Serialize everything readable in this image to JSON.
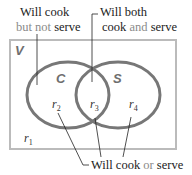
{
  "diagram": {
    "type": "venn",
    "universe": {
      "label": "V",
      "x": 10,
      "y": 40,
      "width": 166,
      "height": 109,
      "stroke": "#bbbbbb"
    },
    "sets": [
      {
        "label": "C",
        "cx": 68,
        "cy": 95,
        "rx": 41,
        "ry": 33,
        "label_x": 56,
        "label_y": 82
      },
      {
        "label": "S",
        "cx": 118,
        "cy": 95,
        "rx": 42,
        "ry": 33,
        "label_x": 113,
        "label_y": 82
      }
    ],
    "circle_stroke": "#777777",
    "regions": [
      {
        "name": "r",
        "sub": "1",
        "x": 24,
        "y": 140
      },
      {
        "name": "r",
        "sub": "2",
        "x": 52,
        "y": 108
      },
      {
        "name": "r",
        "sub": "3",
        "x": 90,
        "y": 108
      },
      {
        "name": "r",
        "sub": "4",
        "x": 129,
        "y": 108
      }
    ],
    "annotations": {
      "cook_not_serve": {
        "line1": "Will cook",
        "line2_light": "but not",
        "line2_dark": " serve"
      },
      "both": {
        "line1": "Will both",
        "line2_dark_a": "cook",
        "line2_light": " and",
        "line2_dark_b": " serve"
      },
      "cook_or_serve": {
        "dark_a": "Will cook",
        "light": " or",
        "dark_b": " serve"
      }
    }
  }
}
